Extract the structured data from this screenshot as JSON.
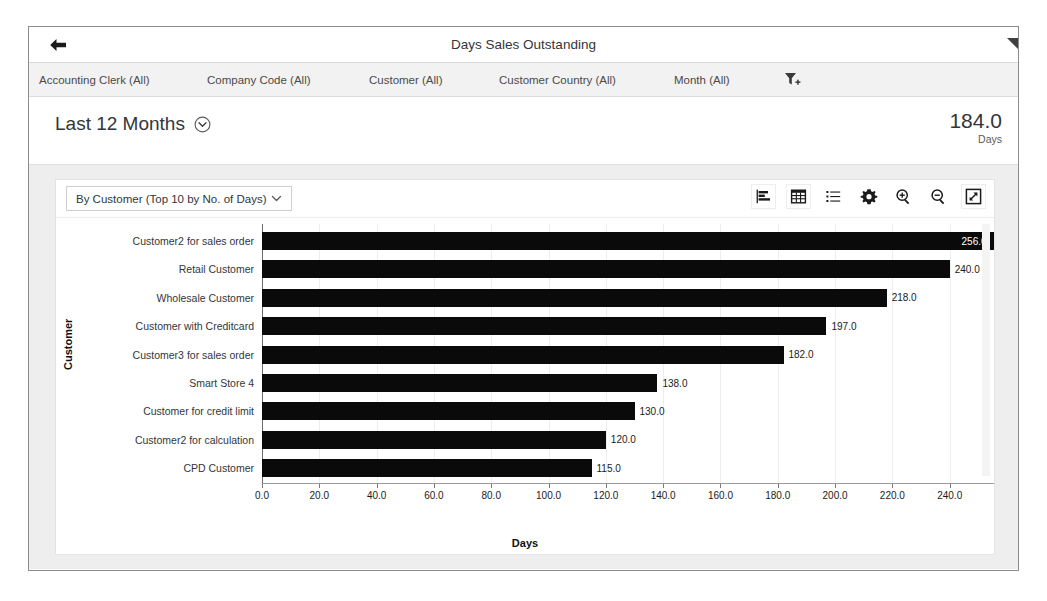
{
  "window": {
    "title": "Days Sales Outstanding",
    "back_icon": "arrow-left-icon",
    "corner_icon": "corner-triangle-icon"
  },
  "filter_bar": {
    "items": [
      {
        "label": "Accounting Clerk (All)",
        "left": 10
      },
      {
        "label": "Company Code (All)",
        "left": 178
      },
      {
        "label": "Company Code (All)_x",
        "left": 0
      }
    ],
    "filters": [
      "Accounting Clerk (All)",
      "Company Code (All)",
      "Customer (All)",
      "Customer Country (All)",
      "Month (All)"
    ],
    "filter_add_icon": "filter-add-icon"
  },
  "kpi": {
    "title": "Last 12 Months",
    "title_icon": "circle-chevron-down-icon",
    "value": "184.0",
    "unit": "Days"
  },
  "chart_toolbar": {
    "view_select_label": "By Customer (Top 10 by No. of Days)",
    "view_select_icon": "chevron-down-icon",
    "icons": [
      {
        "name": "bar-chart-icon",
        "boxed": true
      },
      {
        "name": "table-grid-icon",
        "boxed": true
      },
      {
        "name": "legend-list-icon",
        "boxed": false
      },
      {
        "name": "settings-gear-icon",
        "boxed": false
      },
      {
        "name": "zoom-in-icon",
        "boxed": false
      },
      {
        "name": "zoom-out-icon",
        "boxed": false
      },
      {
        "name": "fullscreen-icon",
        "boxed": true
      }
    ]
  },
  "chart_data": {
    "type": "bar",
    "orientation": "horizontal",
    "title": "",
    "xlabel": "Days",
    "ylabel": "Customer",
    "xlim": [
      0,
      260
    ],
    "xticks": [
      0.0,
      20.0,
      40.0,
      60.0,
      80.0,
      100.0,
      120.0,
      140.0,
      160.0,
      180.0,
      200.0,
      220.0,
      240.0,
      260.0
    ],
    "xtick_labels": [
      "0.0",
      "20.0",
      "40.0",
      "60.0",
      "80.0",
      "100.0",
      "120.0",
      "140.0",
      "160.0",
      "180.0",
      "200.0",
      "220.0",
      "240.0",
      "260.0"
    ],
    "grid": true,
    "legend": "none",
    "bar_color": "#0a0a0a",
    "categories": [
      "Customer2 for sales order",
      "Retail Customer",
      "Wholesale Customer",
      "Customer with Creditcard",
      "Customer3 for sales order",
      "Smart Store 4",
      "Customer for credit limit",
      "Customer2 for calculation",
      "CPD Customer"
    ],
    "values": [
      256.0,
      240.0,
      218.0,
      197.0,
      182.0,
      138.0,
      130.0,
      120.0,
      115.0
    ],
    "value_labels": [
      "256.0",
      "240.0",
      "218.0",
      "197.0",
      "182.0",
      "138.0",
      "130.0",
      "120.0",
      "115.0"
    ]
  }
}
